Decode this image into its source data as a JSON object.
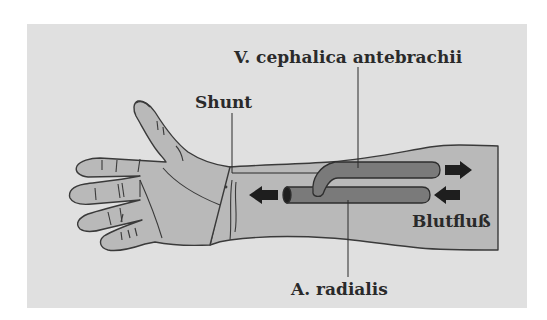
{
  "figure": {
    "type": "anatomical-diagram",
    "colors": {
      "page_background": "#ffffff",
      "panel_background": "#e0e0e0",
      "skin": "#b9b9b9",
      "outline": "#3a3a3a",
      "vessel": "#7a7a7a",
      "vessel_outline": "#2e2e2e",
      "arrow": "#1e1e1e",
      "text": "#2a2a2a"
    },
    "labels": {
      "vein": "V. cephalica antebrachii",
      "shunt": "Shunt",
      "blood_flow": "Blutfluß",
      "artery": "A. radialis"
    },
    "arrows": [
      {
        "name": "vein-outflow-arrow",
        "direction": "right"
      },
      {
        "name": "artery-outflow-arrow",
        "direction": "left"
      },
      {
        "name": "artery-inflow-arrow",
        "direction": "left"
      }
    ]
  }
}
